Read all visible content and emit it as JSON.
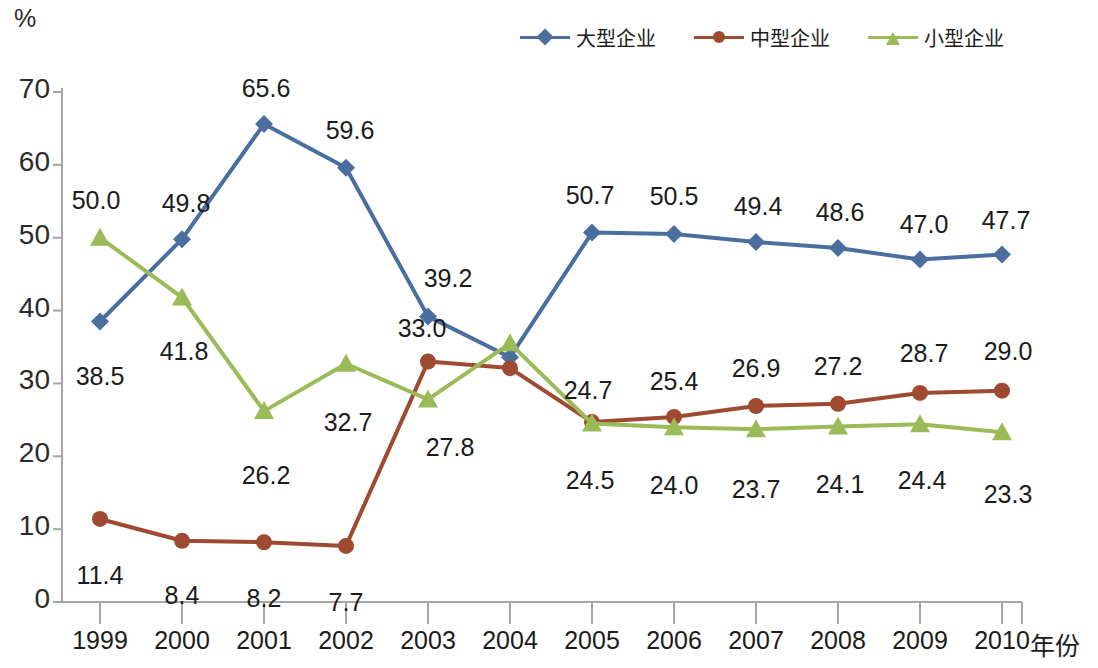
{
  "chart_data": {
    "type": "line",
    "title": "",
    "subtitle": "",
    "xlabel": "年份",
    "ylabel": "%",
    "unit_label": "%",
    "categories": [
      "1999",
      "2000",
      "2001",
      "2002",
      "2003",
      "2004",
      "2005",
      "2006",
      "2007",
      "2008",
      "2009",
      "2010"
    ],
    "x": [
      1999,
      2000,
      2001,
      2002,
      2003,
      2004,
      2005,
      2006,
      2007,
      2008,
      2009,
      2010
    ],
    "xlim": [
      1999,
      2010
    ],
    "ylim": [
      0,
      70
    ],
    "yticks": [
      "0",
      "10",
      "20",
      "30",
      "40",
      "50",
      "60",
      "70"
    ],
    "ytick_values": [
      0,
      10,
      20,
      30,
      40,
      50,
      60,
      70
    ],
    "grid": false,
    "legend_position": "top-right",
    "series": [
      {
        "name": "大型企业",
        "color": "#4A6E9E",
        "marker": "diamond",
        "values": [
          38.5,
          49.8,
          65.6,
          59.6,
          39.2,
          33.6,
          50.7,
          50.5,
          49.4,
          48.6,
          47.0,
          47.7
        ],
        "labels": [
          "38.5",
          "49.8",
          "65.6",
          "59.6",
          "39.2",
          "",
          "50.7",
          "50.5",
          "49.4",
          "48.6",
          "47.0",
          "47.7"
        ],
        "label_positions": [
          "below",
          "above",
          "above",
          "above",
          "above",
          "",
          "above",
          "above",
          "above",
          "above",
          "above",
          "above"
        ]
      },
      {
        "name": "中型企业",
        "color": "#9E4A30",
        "marker": "circle",
        "values": [
          11.4,
          8.4,
          8.2,
          7.7,
          33.0,
          32.1,
          24.7,
          25.4,
          26.9,
          27.2,
          28.7,
          29.0
        ],
        "labels": [
          "11.4",
          "8.4",
          "8.2",
          "7.7",
          "33.0",
          "",
          "24.7",
          "25.4",
          "26.9",
          "27.2",
          "28.7",
          "29.0"
        ],
        "label_positions": [
          "below",
          "below",
          "below",
          "below",
          "above",
          "",
          "above",
          "above",
          "above",
          "above",
          "above",
          "above"
        ]
      },
      {
        "name": "小型企业",
        "color": "#9BBB59",
        "marker": "triangle",
        "values": [
          50.0,
          41.8,
          26.2,
          32.7,
          27.8,
          35.5,
          24.5,
          24.0,
          23.7,
          24.1,
          24.4,
          23.3
        ],
        "labels": [
          "50.0",
          "41.8",
          "26.2",
          "32.7",
          "27.8",
          "",
          "24.5",
          "24.0",
          "23.7",
          "24.1",
          "24.4",
          "23.3"
        ],
        "label_positions": [
          "above",
          "below",
          "below",
          "below",
          "below",
          "",
          "below",
          "below",
          "below",
          "below",
          "below",
          "below"
        ]
      }
    ],
    "axis_color": "#A6A6A6",
    "text_color": "#1b1b1b",
    "geometry": {
      "x_first_px": 100,
      "x_step_px": 82,
      "y_zero_px": 602,
      "y_top_px": 92,
      "y_top_value": 70
    },
    "label_overrides": {
      "0": {
        "0": {
          "dx": 0,
          "dy": 40
        },
        "1": {
          "dx": 0,
          "dy": 42
        },
        "2": {
          "dx": -4,
          "dy": -52
        }
      },
      "1": {
        "0": {
          "dx": 4,
          "dy": -50
        },
        "1": {
          "dx": 0,
          "dy": 40
        },
        "2": {
          "dx": 2,
          "dy": 40
        }
      },
      "2": {
        "0": {
          "dx": 2,
          "dy": -50
        },
        "1": {
          "dx": 0,
          "dy": 42
        },
        "2": {
          "dx": 2,
          "dy": 50
        }
      },
      "3": {
        "0": {
          "dx": 4,
          "dy": -52
        },
        "1": {
          "dx": 0,
          "dy": 42
        },
        "2": {
          "dx": 2,
          "dy": 44
        }
      },
      "4": {
        "0": {
          "dx": 20,
          "dy": -52
        },
        "1": {
          "dx": -6,
          "dy": -48
        },
        "2": {
          "dx": 22,
          "dy": 34
        }
      },
      "6": {
        "0": {
          "dx": -2,
          "dy": -52
        },
        "1": {
          "dx": -4,
          "dy": -46
        },
        "2": {
          "dx": -2,
          "dy": 42
        }
      },
      "7": {
        "0": {
          "dx": 0,
          "dy": -52
        },
        "1": {
          "dx": 0,
          "dy": -50
        },
        "2": {
          "dx": 0,
          "dy": 44
        }
      },
      "8": {
        "0": {
          "dx": 2,
          "dy": -50
        },
        "1": {
          "dx": 0,
          "dy": -52
        },
        "2": {
          "dx": 0,
          "dy": 46
        }
      },
      "9": {
        "0": {
          "dx": 2,
          "dy": -50
        },
        "1": {
          "dx": 0,
          "dy": -52
        },
        "2": {
          "dx": 2,
          "dy": 44
        }
      },
      "10": {
        "0": {
          "dx": 4,
          "dy": -50
        },
        "1": {
          "dx": 4,
          "dy": -54
        },
        "2": {
          "dx": 2,
          "dy": 42
        }
      },
      "11": {
        "0": {
          "dx": 4,
          "dy": -48
        },
        "1": {
          "dx": 6,
          "dy": -54
        },
        "2": {
          "dx": 6,
          "dy": 48
        }
      }
    }
  },
  "legend": {
    "items": [
      {
        "label": "大型企业",
        "color": "#4A6E9E",
        "marker": "diamond"
      },
      {
        "label": "中型企业",
        "color": "#9E4A30",
        "marker": "circle"
      },
      {
        "label": "小型企业",
        "color": "#9BBB59",
        "marker": "triangle"
      }
    ]
  }
}
